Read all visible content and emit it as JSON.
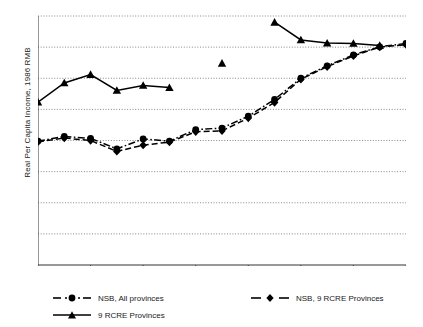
{
  "chart_data": {
    "type": "line",
    "title": "",
    "xlabel": "",
    "ylabel": "Real Per Capita Income, 1986 RMB",
    "xlim": [
      1986,
      2000
    ],
    "ylim": [
      0,
      800
    ],
    "ytick_values": [
      0,
      100,
      200,
      300,
      400,
      500,
      600,
      700,
      800
    ],
    "ytick_labels": [
      "0",
      "100",
      "200",
      "300",
      "400",
      "500",
      "600",
      "700",
      "800"
    ],
    "xtick_values": [
      1986,
      1988,
      1990,
      1992,
      1994,
      1996,
      1998,
      2000
    ],
    "xtick_labels": [
      "1986",
      "1988",
      "1990",
      "1992",
      "1994",
      "1996",
      "1998",
      "2000"
    ],
    "x_minor_ticks": [
      1987,
      1989,
      1991,
      1993,
      1995,
      1997,
      1999
    ],
    "grid": "horizontal-dotted",
    "legend_position": "below-axes",
    "series": [
      {
        "name": "NSB, All provinces",
        "marker": "circle",
        "linestyle": "dash-dot",
        "color": "#000000",
        "x": [
          1986,
          1987,
          1988,
          1989,
          1990,
          1991,
          1992,
          1993,
          1994,
          1995,
          1996,
          1997,
          1998,
          1999,
          2000
        ],
        "values": [
          398,
          413,
          407,
          373,
          405,
          398,
          435,
          440,
          478,
          532,
          600,
          640,
          675,
          701,
          712
        ]
      },
      {
        "name": "NSB, 9 RCRE Provinces",
        "marker": "diamond",
        "linestyle": "dashed",
        "color": "#000000",
        "x": [
          1986,
          1987,
          1988,
          1989,
          1990,
          1991,
          1992,
          1993,
          1994,
          1995,
          1996,
          1997,
          1998,
          1999,
          2000
        ],
        "values": [
          396,
          408,
          400,
          365,
          385,
          395,
          428,
          431,
          472,
          522,
          597,
          637,
          672,
          700,
          708
        ]
      },
      {
        "name": "9 RCRE Provinces",
        "marker": "triangle",
        "linestyle": "solid",
        "color": "#000000",
        "x": [
          1986,
          1987,
          1988,
          1989,
          1990,
          1991,
          1993,
          1995,
          1996,
          1997,
          1998,
          1999
        ],
        "values": [
          523,
          585,
          612,
          561,
          577,
          570,
          648,
          780,
          723,
          713,
          712,
          705
        ],
        "segments": [
          {
            "x": [
              1986,
              1987,
              1988,
              1989,
              1990,
              1991
            ],
            "values": [
              523,
              585,
              612,
              561,
              577,
              570
            ]
          },
          {
            "x": [
              1993
            ],
            "values": [
              648
            ]
          },
          {
            "x": [
              1995,
              1996,
              1997,
              1998,
              1999
            ],
            "values": [
              780,
              723,
              713,
              712,
              705
            ]
          }
        ]
      }
    ]
  },
  "legend": {
    "entries": [
      {
        "label": "NSB, All provinces",
        "marker": "circle",
        "linestyle": "dash-dot"
      },
      {
        "label": "NSB, 9 RCRE Provinces",
        "marker": "diamond",
        "linestyle": "dashed"
      },
      {
        "label": "9 RCRE Provinces",
        "marker": "triangle",
        "linestyle": "solid"
      }
    ]
  }
}
